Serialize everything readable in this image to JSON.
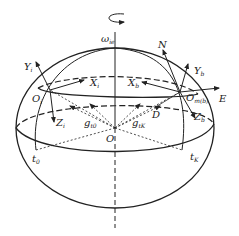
{
  "diagram": {
    "type": "earth-ellipsoid-geometry",
    "labels": {
      "omega": {
        "main": "ω",
        "sub": "ie"
      },
      "N": {
        "main": "N",
        "sub": ""
      },
      "E": {
        "main": "E",
        "sub": ""
      },
      "Yi": {
        "main": "Y",
        "sub": "i"
      },
      "Xi": {
        "main": "X",
        "sub": "i"
      },
      "Zi": {
        "main": "Z",
        "sub": "i"
      },
      "Oi": {
        "main": "O",
        "sub": "i"
      },
      "Yb": {
        "main": "Y",
        "sub": "b"
      },
      "Xb": {
        "main": "X",
        "sub": "b"
      },
      "Zb": {
        "main": "Z",
        "sub": "b"
      },
      "Omb": {
        "main": "O",
        "sub": "m(b)"
      },
      "D": {
        "main": "D",
        "sub": ""
      },
      "O": {
        "main": "O",
        "sub": ""
      },
      "g0": {
        "main": "g",
        "sub": "t0"
      },
      "gK": {
        "main": "g",
        "sub": "tK"
      },
      "t0": {
        "main": "t",
        "sub": "0"
      },
      "tK": {
        "main": "t",
        "sub": "K"
      }
    },
    "colors": {
      "stroke": "#222222",
      "background": "#ffffff"
    }
  }
}
